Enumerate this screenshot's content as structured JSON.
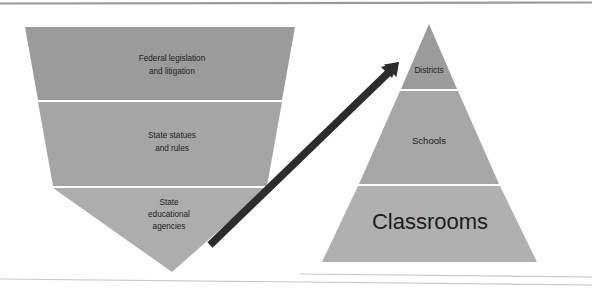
{
  "figure": {
    "type": "diagram",
    "background_color": "#fefefe",
    "page_rules": {
      "top_rule_color": "#9a9a9a",
      "bottom_rule_color": "#c9c9c9"
    },
    "funnel": {
      "name": "inverted-triangle-governance",
      "orientation": "inverted",
      "shape_colors": [
        "#9b9b9b",
        "#a5a5a5",
        "#adadad"
      ],
      "tiers": [
        {
          "id": "federal",
          "label_lines": [
            "Federal legislation",
            "and litigation"
          ],
          "label_text": "Federal legislation and litigation",
          "fill": "#9b9b9b",
          "order": 1
        },
        {
          "id": "state-statutes",
          "label_lines": [
            "State statues",
            "and rules"
          ],
          "label_text": "State statues and rules",
          "fill": "#a5a5a5",
          "order": 2
        },
        {
          "id": "state-agencies",
          "label_lines": [
            "State",
            "educational",
            "agencies"
          ],
          "label_text": "State educational agencies",
          "fill": "#adadad",
          "order": 3
        }
      ]
    },
    "pyramid": {
      "name": "pyramid-implementation",
      "orientation": "upright",
      "shape_colors": [
        "#9b9b9b",
        "#a7a7a7",
        "#b0b0b0"
      ],
      "tiers": [
        {
          "id": "districts",
          "label_text": "Districts",
          "fill": "#9b9b9b",
          "order": 1,
          "text_size": "small"
        },
        {
          "id": "schools",
          "label_text": "Schools",
          "fill": "#a7a7a7",
          "order": 2,
          "text_size": "medium"
        },
        {
          "id": "classrooms",
          "label_text": "Classrooms",
          "fill": "#b0b0b0",
          "order": 3,
          "text_size": "large"
        }
      ]
    },
    "arrow": {
      "name": "upward-arrow",
      "color": "#2c2c2c",
      "direction": "up-right",
      "from": "state educational agencies",
      "to": "districts",
      "tail_point": [
        210,
        245
      ],
      "tip_point": [
        399,
        62
      ]
    }
  }
}
